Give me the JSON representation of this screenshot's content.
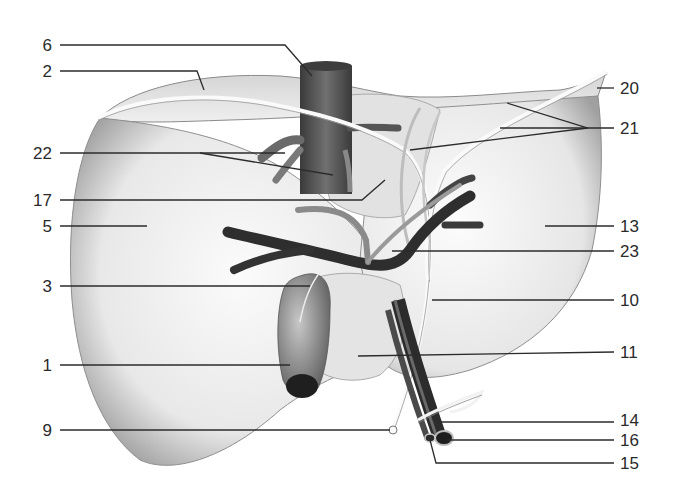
{
  "diagram": {
    "colors": {
      "background": "#ffffff",
      "liver_fill": "#ececec",
      "liver_shadow": "#9a9a9a",
      "vessel_dark": "#2e2e2e",
      "vessel_mid": "#7a7a7a",
      "ligament": "#f4f4f4",
      "text": "#2a2a2a",
      "leader": "#2b2b2b"
    },
    "labels": [
      {
        "id": "6",
        "text": "6",
        "side": "left",
        "x": 52,
        "y": 45,
        "target": [
          310,
          75
        ]
      },
      {
        "id": "2",
        "text": "2",
        "side": "left",
        "x": 52,
        "y": 71,
        "target": [
          202,
          90
        ]
      },
      {
        "id": "22",
        "text": "22",
        "side": "left",
        "x": 52,
        "y": 153,
        "target": [
          285,
          153
        ]
      },
      {
        "id": "17",
        "text": "17",
        "side": "left",
        "x": 52,
        "y": 200,
        "target": [
          385,
          178
        ]
      },
      {
        "id": "5",
        "text": "5",
        "side": "left",
        "x": 52,
        "y": 226,
        "target": [
          147,
          226
        ]
      },
      {
        "id": "3",
        "text": "3",
        "side": "left",
        "x": 52,
        "y": 286,
        "target": [
          310,
          286
        ]
      },
      {
        "id": "1",
        "text": "1",
        "side": "left",
        "x": 52,
        "y": 365,
        "target": [
          290,
          365
        ]
      },
      {
        "id": "9",
        "text": "9",
        "side": "left",
        "x": 52,
        "y": 430,
        "target": [
          392,
          430
        ]
      },
      {
        "id": "20",
        "text": "20",
        "side": "right",
        "x": 620,
        "y": 88,
        "target": [
          596,
          88
        ]
      },
      {
        "id": "21",
        "text": "21",
        "side": "right",
        "x": 620,
        "y": 128,
        "target": [
          586,
          128
        ]
      },
      {
        "id": "13",
        "text": "13",
        "side": "right",
        "x": 620,
        "y": 226,
        "target": [
          545,
          226
        ]
      },
      {
        "id": "23",
        "text": "23",
        "side": "right",
        "x": 620,
        "y": 251,
        "target": [
          392,
          251
        ]
      },
      {
        "id": "10",
        "text": "10",
        "side": "right",
        "x": 620,
        "y": 300,
        "target": [
          432,
          300
        ]
      },
      {
        "id": "11",
        "text": "11",
        "side": "right",
        "x": 620,
        "y": 352,
        "target": [
          358,
          356
        ]
      },
      {
        "id": "14",
        "text": "14",
        "side": "right",
        "x": 620,
        "y": 420,
        "target": [
          438,
          422
        ]
      },
      {
        "id": "16",
        "text": "16",
        "side": "right",
        "x": 620,
        "y": 440,
        "target": [
          446,
          440
        ]
      },
      {
        "id": "15",
        "text": "15",
        "side": "right",
        "x": 620,
        "y": 463,
        "target": [
          432,
          463
        ]
      }
    ]
  }
}
